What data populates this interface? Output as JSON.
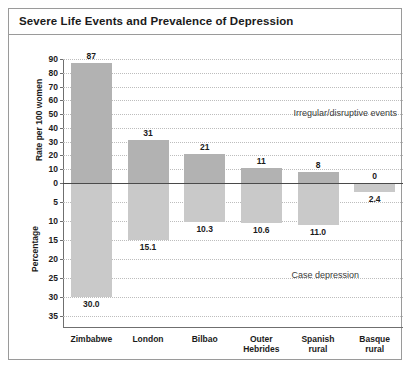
{
  "title": "Severe Life Events and Prevalence of Depression",
  "chart_data": {
    "type": "bar",
    "title": "Severe Life Events and Prevalence of Depression",
    "xlabel": "",
    "ylabel_top": "Rate per 100 women",
    "ylabel_bottom": "Percentage",
    "grid": true,
    "legend_position": "inline-annotations",
    "categories": [
      "Zimbabwe",
      "London",
      "Bilbao",
      "Outer Hebrides",
      "Spanish rural",
      "Basque rural"
    ],
    "category_lines": [
      [
        "Zimbabwe"
      ],
      [
        "London"
      ],
      [
        "Bilbao"
      ],
      [
        "Outer",
        "Hebrides"
      ],
      [
        "Spanish",
        "rural"
      ],
      [
        "Basque",
        "rural"
      ]
    ],
    "series": [
      {
        "name": "Irregular/disruptive events",
        "axis": "top",
        "units": "Rate per 100 women",
        "ylim": [
          0,
          90
        ],
        "yticks": [
          90,
          80,
          70,
          60,
          50,
          40,
          30,
          20,
          10,
          0
        ],
        "color": "#b2b2b2",
        "values": [
          87,
          31,
          21,
          11,
          8,
          0
        ],
        "value_labels": [
          "87",
          "31",
          "21",
          "11",
          "8",
          "0"
        ]
      },
      {
        "name": "Case depression",
        "axis": "bottom",
        "units": "Percentage",
        "ylim": [
          0,
          35
        ],
        "yticks": [
          0,
          5,
          10,
          15,
          20,
          25,
          30,
          35
        ],
        "color": "#c9c9c9",
        "values": [
          30.0,
          15.1,
          10.3,
          10.6,
          11.0,
          2.4
        ],
        "value_labels": [
          "30.0",
          "15.1",
          "10.3",
          "10.6",
          "11.0",
          "2.4"
        ]
      }
    ],
    "annotations": [
      {
        "text": "Irregular/disruptive events",
        "region": "upper"
      },
      {
        "text": "Case depression",
        "region": "lower"
      }
    ]
  },
  "colors": {
    "bar_upper": "#b2b2b2",
    "bar_lower": "#c9c9c9",
    "frame_border": "#9a9a9a",
    "grid": "#bdbdbd",
    "axis": "#6f6f6f",
    "zero_line": "#4a4a4a",
    "text": "#1b1b1b"
  }
}
